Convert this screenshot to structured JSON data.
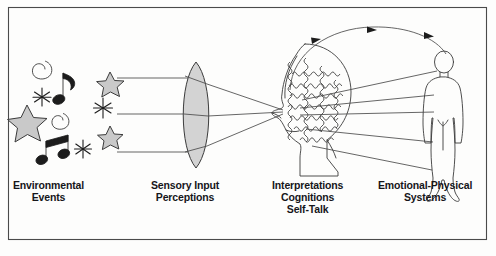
{
  "figure": {
    "frame": {
      "border_color": "#4a4a4a"
    },
    "background_color": "#fdfdfc",
    "ink_color": "#3b3b3b"
  },
  "captions": {
    "environmental": {
      "line1": "Environmental",
      "line2": "Events"
    },
    "sensory": {
      "line1": "Sensory Input",
      "line2": "Perceptions"
    },
    "interpretations": {
      "line1": "Interpretations",
      "line2": "Cognitions",
      "line3": "Self-Talk"
    },
    "emotional": {
      "line1": "Emotional-Physical",
      "line2": "Systems"
    }
  },
  "elements": {
    "stimuli_group": "environmental-stimuli-symbols",
    "stimuli_items": [
      "spiral-icon",
      "star-icon",
      "music-note-icon",
      "sparkle-icon",
      "spiral-icon",
      "star-icon",
      "sparkle-icon",
      "star-icon",
      "music-note-icon",
      "sparkle-icon"
    ],
    "lens": "sensory-lens-icon",
    "head": "head-profile-icon",
    "thought_waves": "thought-squiggle-lines",
    "body": "human-body-figure-icon",
    "incoming_rays": 3,
    "converging_rays": 3,
    "outgoing_rays": 5,
    "feedback_arc": "feedback-loop-arrow",
    "feedback_arrowheads": 3
  }
}
